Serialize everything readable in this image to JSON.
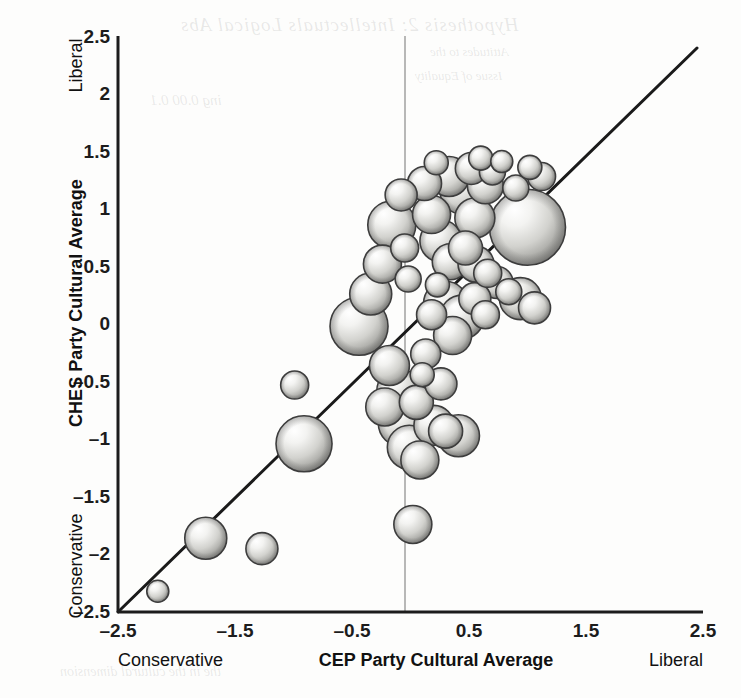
{
  "figure": {
    "background_color": "#fdfdfc",
    "bubble_fill_light": "#f4f4f2",
    "bubble_fill_dark": "#8e8e8c",
    "bubble_stroke": "#3b3b3b",
    "axis_color": "#1c1c1c",
    "zero_line_color": "#9a9a9a",
    "diagonal_color": "#1a1a1a"
  },
  "axes": {
    "x": {
      "caption_left": "Conservative",
      "caption_center": "CEP Party Cultural Average",
      "caption_right": "Liberal",
      "ticks": [
        "–2.5",
        "–1.5",
        "–0.5",
        "0.5",
        "1.5",
        "2.5"
      ],
      "tick_values": [
        -2.5,
        -1.5,
        -0.5,
        0.5,
        1.5,
        2.5
      ]
    },
    "y": {
      "caption_left": "Conservative",
      "caption_center": "CHES Party Cultural Average",
      "caption_right": "Liberal",
      "ticks": [
        "2.5",
        "2",
        "1.5",
        "1",
        "0.5",
        "0",
        "–0.5",
        "–1",
        "–1.5",
        "–2",
        "–2.5"
      ],
      "tick_values": [
        2.5,
        2,
        1.5,
        1,
        0.5,
        0,
        -0.5,
        -1,
        -1.5,
        -2,
        -2.5
      ]
    }
  },
  "chart_data": {
    "type": "scatter",
    "title": "",
    "subtitle": "",
    "xlabel": "CEP Party Cultural Average",
    "ylabel": "CHES Party Cultural Average",
    "xlim": [
      -2.5,
      2.5
    ],
    "ylim": [
      -2.5,
      2.5
    ],
    "grid": false,
    "legend": "none",
    "annotations": [
      {
        "text": "45-degree reference line (y = x)",
        "type": "line",
        "from": [
          -2.5,
          -2.5
        ],
        "to": [
          2.45,
          2.45
        ]
      },
      {
        "text": "vertical reference line at x = 0",
        "type": "vline",
        "x": 0.0
      }
    ],
    "marker_style": "shaded-sphere-bubble",
    "size_encodes": "party vote share / weight",
    "points": [
      {
        "x": -2.16,
        "y": -2.32,
        "size": 11
      },
      {
        "x": -1.75,
        "y": -1.86,
        "size": 21
      },
      {
        "x": -1.27,
        "y": -1.95,
        "size": 16
      },
      {
        "x": -0.91,
        "y": -1.04,
        "size": 28
      },
      {
        "x": -0.99,
        "y": -0.53,
        "size": 14
      },
      {
        "x": -0.44,
        "y": -0.02,
        "size": 29
      },
      {
        "x": -0.34,
        "y": 0.26,
        "size": 21
      },
      {
        "x": -0.24,
        "y": 0.52,
        "size": 19
      },
      {
        "x": -0.16,
        "y": 0.86,
        "size": 24
      },
      {
        "x": -0.08,
        "y": 1.12,
        "size": 16
      },
      {
        "x": -0.05,
        "y": 0.66,
        "size": 14
      },
      {
        "x": -0.02,
        "y": 0.39,
        "size": 13
      },
      {
        "x": -0.18,
        "y": -0.36,
        "size": 20
      },
      {
        "x": -0.1,
        "y": -0.58,
        "size": 22
      },
      {
        "x": -0.22,
        "y": -0.72,
        "size": 19
      },
      {
        "x": -0.07,
        "y": -0.86,
        "size": 24
      },
      {
        "x": -0.01,
        "y": -1.07,
        "size": 22
      },
      {
        "x": 0.05,
        "y": -0.68,
        "size": 17
      },
      {
        "x": 0.1,
        "y": -0.44,
        "size": 12
      },
      {
        "x": 0.13,
        "y": -0.26,
        "size": 15
      },
      {
        "x": 0.08,
        "y": -1.18,
        "size": 19
      },
      {
        "x": 0.02,
        "y": -1.74,
        "size": 19
      },
      {
        "x": 0.2,
        "y": -0.88,
        "size": 20
      },
      {
        "x": 0.3,
        "y": -0.93,
        "size": 17
      },
      {
        "x": 0.41,
        "y": -0.97,
        "size": 21
      },
      {
        "x": 0.26,
        "y": -0.52,
        "size": 16
      },
      {
        "x": 0.36,
        "y": -0.1,
        "size": 19
      },
      {
        "x": 0.3,
        "y": 0.18,
        "size": 22
      },
      {
        "x": 0.18,
        "y": 0.08,
        "size": 15
      },
      {
        "x": 0.23,
        "y": 0.34,
        "size": 12
      },
      {
        "x": 0.34,
        "y": 0.54,
        "size": 18
      },
      {
        "x": 0.26,
        "y": 0.72,
        "size": 21
      },
      {
        "x": 0.18,
        "y": 0.95,
        "size": 19
      },
      {
        "x": 0.12,
        "y": 1.22,
        "size": 17
      },
      {
        "x": 0.22,
        "y": 1.4,
        "size": 12
      },
      {
        "x": 0.33,
        "y": 1.28,
        "size": 20
      },
      {
        "x": 0.45,
        "y": 1.15,
        "size": 23
      },
      {
        "x": 0.52,
        "y": 1.35,
        "size": 16
      },
      {
        "x": 0.6,
        "y": 1.44,
        "size": 12
      },
      {
        "x": 0.64,
        "y": 1.2,
        "size": 18
      },
      {
        "x": 0.7,
        "y": 1.32,
        "size": 13
      },
      {
        "x": 0.78,
        "y": 1.41,
        "size": 11
      },
      {
        "x": 0.55,
        "y": 0.92,
        "size": 20
      },
      {
        "x": 0.47,
        "y": 0.66,
        "size": 17
      },
      {
        "x": 0.56,
        "y": 0.52,
        "size": 18
      },
      {
        "x": 0.66,
        "y": 0.44,
        "size": 14
      },
      {
        "x": 0.74,
        "y": 0.36,
        "size": 16
      },
      {
        "x": 0.84,
        "y": 0.28,
        "size": 13
      },
      {
        "x": 0.94,
        "y": 0.22,
        "size": 21
      },
      {
        "x": 0.64,
        "y": 0.08,
        "size": 14
      },
      {
        "x": 0.55,
        "y": 0.22,
        "size": 16
      },
      {
        "x": 1.0,
        "y": 0.84,
        "size": 38
      },
      {
        "x": 1.06,
        "y": 0.14,
        "size": 16
      },
      {
        "x": 1.12,
        "y": 1.28,
        "size": 14
      },
      {
        "x": 1.02,
        "y": 1.36,
        "size": 12
      },
      {
        "x": 0.9,
        "y": 1.18,
        "size": 13
      },
      {
        "x": 0.44,
        "y": 0.06,
        "size": 22
      }
    ]
  }
}
